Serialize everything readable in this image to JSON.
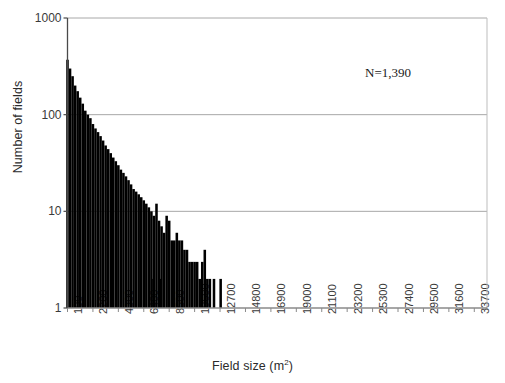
{
  "chart_data": {
    "type": "bar",
    "title": "",
    "subtitle": "",
    "xlabel": "Field size (m",
    "xlabel_sup": "2",
    "xlabel_suffix": ")",
    "ylabel": "Number of fields",
    "annotation": "N=1,390",
    "yscale": "log",
    "ylim": [
      1,
      1000
    ],
    "ytick_labels": [
      "1000",
      "100",
      "10",
      "1"
    ],
    "ytick_values": [
      1000,
      100,
      10,
      1
    ],
    "grid": "horizontal gridlines at 1000, 100, 10",
    "legend": "none",
    "xlim": [
      100,
      34750
    ],
    "xtick_labels": [
      "100",
      "2200",
      "4300",
      "6400",
      "8500",
      "10600",
      "12700",
      "14800",
      "16900",
      "19000",
      "21100",
      "23200",
      "25300",
      "27400",
      "29500",
      "31600",
      "33700"
    ],
    "xtick_values": [
      100,
      2200,
      4300,
      6400,
      8500,
      10600,
      12700,
      14800,
      16900,
      19000,
      21100,
      23200,
      25300,
      27400,
      29500,
      31600,
      33700
    ],
    "bin_width": 210,
    "categories": [
      100,
      310,
      520,
      730,
      940,
      1150,
      1360,
      1570,
      1780,
      1990,
      2200,
      2410,
      2620,
      2830,
      3040,
      3250,
      3460,
      3670,
      3880,
      4090,
      4300,
      4510,
      4720,
      4930,
      5140,
      5350,
      5560,
      5770,
      5980,
      6190,
      6400,
      6610,
      6820,
      7030,
      7240,
      7450,
      7660,
      7870,
      8080,
      8290,
      8500,
      8710,
      8920,
      9130,
      9340,
      9550,
      9760,
      9970,
      10180,
      10390,
      10600,
      10810,
      11020,
      11230,
      11440,
      11650,
      11860,
      12070,
      12280,
      12490,
      12700
    ],
    "values": [
      370,
      300,
      250,
      200,
      175,
      150,
      130,
      110,
      100,
      92,
      80,
      72,
      66,
      60,
      54,
      48,
      44,
      40,
      36,
      33,
      30,
      27,
      25,
      23,
      21,
      19,
      17,
      16,
      15,
      14,
      13,
      12,
      11,
      10,
      9,
      12,
      8,
      7,
      6,
      9,
      8,
      5,
      5,
      6,
      5,
      5,
      4,
      4,
      3,
      3,
      3,
      3,
      2,
      3,
      4,
      2,
      2,
      1,
      1,
      1,
      1
    ],
    "isolated_bars": [
      {
        "x": 7200,
        "value": 2
      },
      {
        "x": 7800,
        "value": 2
      },
      {
        "x": 12200,
        "value": 2
      },
      {
        "x": 12750,
        "value": 2
      }
    ]
  },
  "figure": {
    "axis_color": "#999999",
    "bar_color": "#000000",
    "text_color": "#2b2b2b",
    "background": "#ffffff"
  }
}
